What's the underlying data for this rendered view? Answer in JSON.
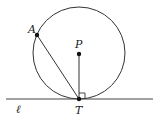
{
  "diagram": {
    "type": "geometry",
    "labels": {
      "A": "A",
      "P": "P",
      "T": "T",
      "line": "ℓ"
    },
    "points": {
      "A": [
        37,
        35
      ],
      "P": [
        79,
        54
      ],
      "T": [
        79,
        99
      ]
    },
    "circle": {
      "center": [
        79,
        53
      ],
      "radius": 46
    },
    "tangent_line": {
      "from": [
        6,
        99
      ],
      "to": [
        153,
        99
      ]
    },
    "right_angle_marker": true,
    "colors": {
      "stroke": "#333333",
      "point": "#111111"
    }
  }
}
